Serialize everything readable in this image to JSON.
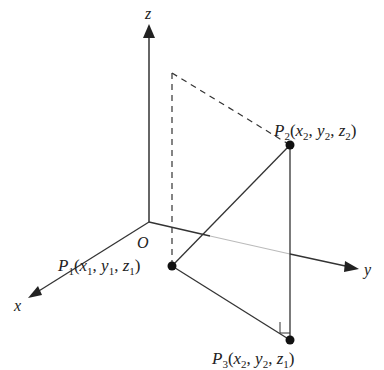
{
  "diagram": {
    "axes": {
      "x_label": "x",
      "y_label": "y",
      "z_label": "z",
      "origin_label": "O"
    },
    "points": [
      {
        "id": "P1",
        "name": "P",
        "sub": "1",
        "coords": [
          "x",
          "1",
          "y",
          "1",
          "z",
          "1"
        ],
        "label": "P1(x1, y1, z1)"
      },
      {
        "id": "P2",
        "name": "P",
        "sub": "2",
        "coords": [
          "x",
          "2",
          "y",
          "2",
          "z",
          "2"
        ],
        "label": "P2(x2, y2, z2)"
      },
      {
        "id": "P3",
        "name": "P",
        "sub": "3",
        "coords": [
          "x",
          "2",
          "y",
          "2",
          "z",
          "1"
        ],
        "label": "P3(x2, y2, z1)"
      }
    ],
    "colors": {
      "line": "#222222",
      "faint_axis": "#bbbbbb"
    }
  }
}
